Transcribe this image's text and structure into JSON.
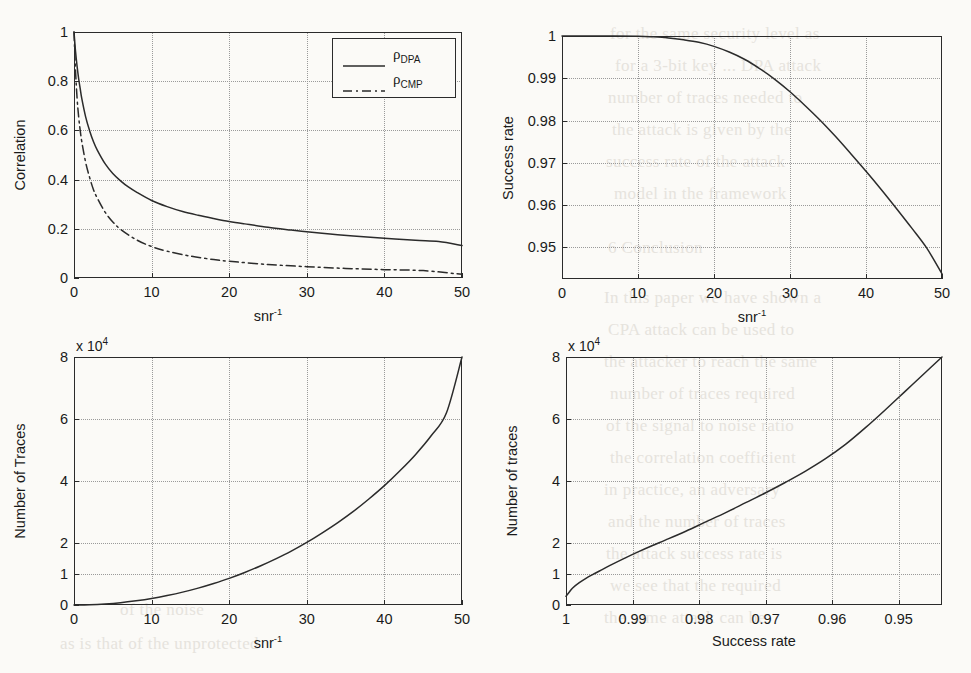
{
  "page": {
    "background_color": "#fbfaf7",
    "ink_color": "#2b2b2b",
    "grid_color": "#9a9a9a"
  },
  "bleed_text": [
    {
      "t": "for the same security level as",
      "x": 610,
      "y": 24
    },
    {
      "t": "for a 3-bit key ... DPA attack",
      "x": 615,
      "y": 56
    },
    {
      "t": "number of traces needed to",
      "x": 608,
      "y": 88
    },
    {
      "t": "the attack is given by the",
      "x": 612,
      "y": 120
    },
    {
      "t": "success rate of the attack",
      "x": 606,
      "y": 152
    },
    {
      "t": "model in the framework",
      "x": 614,
      "y": 184
    },
    {
      "t": "6  Conclusion",
      "x": 608,
      "y": 238
    },
    {
      "t": "In this paper we have shown a",
      "x": 604,
      "y": 288
    },
    {
      "t": "CPA attack can be used to",
      "x": 608,
      "y": 320
    },
    {
      "t": "the attacker to reach the same",
      "x": 604,
      "y": 352
    },
    {
      "t": "number of traces required",
      "x": 610,
      "y": 384
    },
    {
      "t": "of the signal to noise ratio",
      "x": 606,
      "y": 416
    },
    {
      "t": "the correlation coefficient",
      "x": 610,
      "y": 448
    },
    {
      "t": "in practice, an adversary",
      "x": 604,
      "y": 480
    },
    {
      "t": "and the number of traces",
      "x": 608,
      "y": 512
    },
    {
      "t": "the attack success rate is",
      "x": 606,
      "y": 544
    },
    {
      "t": "we see that the required",
      "x": 610,
      "y": 576
    },
    {
      "t": "the same attack can be",
      "x": 604,
      "y": 608
    },
    {
      "t": "as is that of the unprotected",
      "x": 60,
      "y": 634
    },
    {
      "t": "of the noise",
      "x": 120,
      "y": 600
    }
  ],
  "charts": [
    {
      "id": "correlation-vs-snr",
      "type": "line",
      "title": "",
      "xlabel": "snr⁻¹",
      "ylabel": "Correlation",
      "xlim": [
        0,
        50
      ],
      "ylim": [
        0,
        1
      ],
      "xticks": [
        0,
        10,
        20,
        30,
        40,
        50
      ],
      "xticklabels": [
        "0",
        "10",
        "20",
        "30",
        "40",
        "50"
      ],
      "yticks": [
        0,
        0.2,
        0.4,
        0.6,
        0.8,
        1
      ],
      "yticklabels": [
        "0",
        "0.2",
        "0.4",
        "0.6",
        "0.8",
        "1"
      ],
      "grid": true,
      "exp_multiplier": "",
      "legend": {
        "position": "top-right",
        "entries": [
          {
            "label": "ρ",
            "sub": "DPA",
            "style": "solid"
          },
          {
            "label": "ρ",
            "sub": "CMP",
            "style": "dashdot"
          }
        ]
      },
      "series": [
        {
          "name": "rho_DPA",
          "style": "solid",
          "x": [
            0,
            0.2,
            0.4,
            0.6,
            0.8,
            1,
            1.5,
            2,
            2.5,
            3,
            4,
            5,
            6,
            7,
            8,
            10,
            12,
            14,
            16,
            18,
            20,
            22,
            25,
            28,
            30,
            33,
            36,
            40,
            44,
            47,
            50
          ],
          "y": [
            1,
            0.92,
            0.86,
            0.81,
            0.77,
            0.73,
            0.655,
            0.6,
            0.555,
            0.52,
            0.465,
            0.425,
            0.395,
            0.37,
            0.35,
            0.315,
            0.29,
            0.27,
            0.255,
            0.242,
            0.23,
            0.22,
            0.206,
            0.195,
            0.188,
            0.179,
            0.171,
            0.162,
            0.153,
            0.148,
            0.132
          ]
        },
        {
          "name": "rho_CMP",
          "style": "dashdot",
          "x": [
            0,
            0.2,
            0.4,
            0.6,
            0.8,
            1,
            1.5,
            2,
            2.5,
            3,
            4,
            5,
            6,
            8,
            10,
            12,
            15,
            18,
            20,
            25,
            30,
            35,
            40,
            45,
            50
          ],
          "y": [
            1,
            0.84,
            0.73,
            0.655,
            0.6,
            0.555,
            0.47,
            0.41,
            0.36,
            0.325,
            0.268,
            0.228,
            0.198,
            0.156,
            0.128,
            0.109,
            0.089,
            0.075,
            0.068,
            0.055,
            0.046,
            0.039,
            0.034,
            0.03,
            0.015
          ]
        }
      ]
    },
    {
      "id": "success-rate-vs-snr",
      "type": "line",
      "title": "",
      "xlabel": "snr⁻¹",
      "ylabel": "Success rate",
      "xlim": [
        0,
        50
      ],
      "ylim": [
        0.9425,
        1
      ],
      "xticks": [
        0,
        10,
        20,
        30,
        40,
        50
      ],
      "xticklabels": [
        "0",
        "10",
        "20",
        "30",
        "40",
        "50"
      ],
      "yticks": [
        0.95,
        0.96,
        0.97,
        0.98,
        0.99,
        1
      ],
      "yticklabels": [
        "0.95",
        "0.96",
        "0.97",
        "0.98",
        "0.99",
        "1"
      ],
      "grid": true,
      "exp_multiplier": "",
      "legend": null,
      "series": [
        {
          "name": "success_rate",
          "style": "solid",
          "x": [
            0,
            5,
            10,
            12,
            14,
            16,
            18,
            20,
            22,
            24,
            26,
            28,
            30,
            32,
            34,
            36,
            38,
            40,
            42,
            44,
            46,
            48,
            50
          ],
          "y": [
            1.0,
            1.0,
            0.99995,
            0.9998,
            0.99955,
            0.9991,
            0.9985,
            0.99755,
            0.9962,
            0.9945,
            0.9923,
            0.98975,
            0.9868,
            0.9835,
            0.98,
            0.9762,
            0.97215,
            0.968,
            0.9637,
            0.9592,
            0.9546,
            0.9498,
            0.9437
          ]
        }
      ]
    },
    {
      "id": "traces-vs-snr",
      "type": "line",
      "title": "",
      "xlabel": "snr⁻¹",
      "ylabel": "Number of Traces",
      "xlim": [
        0,
        50
      ],
      "ylim": [
        0,
        8
      ],
      "xticks": [
        0,
        10,
        20,
        30,
        40,
        50
      ],
      "xticklabels": [
        "0",
        "10",
        "20",
        "30",
        "40",
        "50"
      ],
      "yticks": [
        0,
        1,
        2,
        4,
        6,
        8
      ],
      "yticklabels": [
        "0",
        "1",
        "2",
        "4",
        "6",
        "8"
      ],
      "grid": true,
      "exp_multiplier": "x 10⁴",
      "legend": null,
      "series": [
        {
          "name": "number_of_traces",
          "style": "solid",
          "x": [
            0,
            2,
            4,
            6,
            8,
            10,
            12,
            14,
            16,
            18,
            20,
            22,
            24,
            26,
            28,
            30,
            32,
            34,
            36,
            38,
            40,
            42,
            44,
            46,
            48,
            50
          ],
          "y": [
            0,
            0.01,
            0.035,
            0.075,
            0.135,
            0.21,
            0.305,
            0.415,
            0.545,
            0.695,
            0.86,
            1.05,
            1.26,
            1.49,
            1.74,
            2.02,
            2.33,
            2.66,
            3.02,
            3.42,
            3.85,
            4.33,
            4.85,
            5.45,
            6.2,
            8.0
          ]
        }
      ]
    },
    {
      "id": "traces-vs-success-rate",
      "type": "line",
      "title": "",
      "xlabel": "Success rate",
      "ylabel": "Number of traces",
      "xlim": [
        1,
        0.9435
      ],
      "ylim": [
        0,
        8
      ],
      "xticks": [
        1,
        0.99,
        0.98,
        0.97,
        0.96,
        0.95
      ],
      "xticklabels": [
        "1",
        "0.99",
        "0.98",
        "0.97",
        "0.96",
        "0.95"
      ],
      "yticks": [
        0,
        1,
        2,
        4,
        6,
        8
      ],
      "yticklabels": [
        "0",
        "1",
        "2",
        "4",
        "6",
        "8"
      ],
      "grid": true,
      "exp_multiplier": "x 10⁴",
      "legend": null,
      "series": [
        {
          "name": "number_of_traces",
          "style": "solid",
          "x": [
            1.0,
            0.9995,
            0.999,
            0.998,
            0.997,
            0.996,
            0.9945,
            0.993,
            0.991,
            0.989,
            0.987,
            0.985,
            0.982,
            0.979,
            0.976,
            0.973,
            0.97,
            0.967,
            0.964,
            0.961,
            0.958,
            0.955,
            0.952,
            0.949,
            0.946,
            0.9435
          ],
          "y": [
            0.28,
            0.42,
            0.55,
            0.72,
            0.86,
            0.98,
            1.15,
            1.32,
            1.53,
            1.73,
            1.92,
            2.1,
            2.38,
            2.68,
            2.98,
            3.3,
            3.62,
            3.96,
            4.32,
            4.72,
            5.18,
            5.72,
            6.3,
            6.9,
            7.5,
            8.0
          ]
        }
      ]
    }
  ]
}
